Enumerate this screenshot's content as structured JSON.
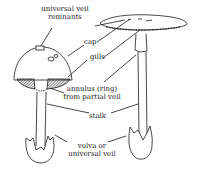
{
  "diagram": {
    "labels": {
      "universal_veil_remnants": [
        "universal veil",
        "remnants"
      ],
      "cap": "cap",
      "gills": "gills",
      "annulus": [
        "annulus (ring)",
        "from partial veil"
      ],
      "stalk": "stalk",
      "volva": [
        "volva or",
        "universal veil"
      ]
    },
    "colors": {
      "ink": "#1a1a1a",
      "background": "#ffffff"
    }
  }
}
